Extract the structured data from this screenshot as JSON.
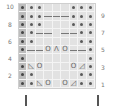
{
  "chart": {
    "title": "",
    "columns": 9,
    "rows": 10,
    "row_labels_left": [
      "10",
      "8",
      "6",
      "4",
      "2"
    ],
    "row_labels_right": [
      "9",
      "7",
      "5",
      "3",
      "1"
    ],
    "legend_symbols": {
      "edge": "dark shaded edge stitch",
      "dot": "purl",
      "blank": "knit",
      "O": "yarn over",
      "Λ": "centered double decrease",
      "◺": "ssk",
      "◿": "k2tog",
      "cable": "cable cross"
    },
    "grid": [
      {
        "row": 10,
        "cells": [
          "edge",
          "dot",
          "dot",
          "",
          "",
          "",
          "dot",
          "dot",
          "dot"
        ]
      },
      {
        "row": 9,
        "cells": [
          "edge",
          "dot",
          "dot",
          "cable-r",
          "cable-r",
          "cable-r",
          "dot",
          "dot",
          "dot"
        ]
      },
      {
        "row": 8,
        "cells": [
          "edge",
          "dot",
          "dot",
          "",
          "",
          "",
          "dot",
          "dot",
          "dot"
        ]
      },
      {
        "row": 7,
        "cells": [
          "edge",
          "dot",
          "cable-r",
          "cable-r",
          "",
          "cable-l",
          "cable-l",
          "dot",
          "dot"
        ]
      },
      {
        "row": 6,
        "cells": [
          "edge",
          "dot",
          "",
          "",
          "",
          "",
          "",
          "dot",
          "dot"
        ]
      },
      {
        "row": 5,
        "cells": [
          "edge",
          "cable-r",
          "cable-r",
          "O",
          "Λ",
          "O",
          "cable-l",
          "cable-l",
          "dot"
        ]
      },
      {
        "row": 4,
        "cells": [
          "edge",
          "",
          "",
          "",
          "",
          "",
          "",
          "",
          "dot"
        ]
      },
      {
        "row": 3,
        "cells": [
          "edge",
          "◺",
          "O",
          "",
          "",
          "",
          "O",
          "◿",
          "dot"
        ]
      },
      {
        "row": 2,
        "cells": [
          "edge",
          "dot",
          "",
          "",
          "",
          "",
          "",
          "dot",
          "dot"
        ]
      },
      {
        "row": 1,
        "cells": [
          "edge",
          "dot",
          "◺",
          "O",
          "",
          "O",
          "◿",
          "dot",
          "dot"
        ]
      }
    ],
    "repeat_markers": [
      "left",
      "right"
    ]
  }
}
